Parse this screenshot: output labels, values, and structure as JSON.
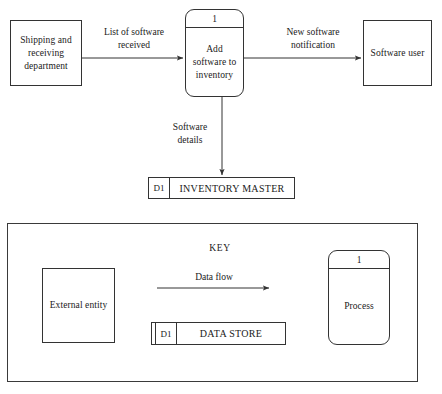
{
  "diagram": {
    "entities": [
      {
        "id": "shipping",
        "label": "Shipping and\nreceiving\ndepartment"
      },
      {
        "id": "software_user",
        "label": "Software\nuser"
      }
    ],
    "processes": [
      {
        "id": "add_software",
        "number": "1",
        "label": "Add\nsoftware to\ninventory"
      }
    ],
    "data_stores": [
      {
        "id": "inventory_master",
        "code": "D1",
        "name": "INVENTORY MASTER"
      }
    ],
    "flows": [
      {
        "id": "list_of_software",
        "label": "List of software\nreceived"
      },
      {
        "id": "new_software_notification",
        "label": "New software\nnotification"
      },
      {
        "id": "software_details",
        "label": "Software\ndetails"
      }
    ]
  },
  "key": {
    "title": "KEY",
    "external_entity_label": "External\nentity",
    "data_flow_label": "Data flow",
    "data_store": {
      "code": "D1",
      "name": "DATA STORE"
    },
    "process": {
      "number": "1",
      "label": "Process"
    }
  },
  "style": {
    "line_color": "#333333",
    "text_color": "#1a1a1a",
    "background": "#ffffff"
  }
}
